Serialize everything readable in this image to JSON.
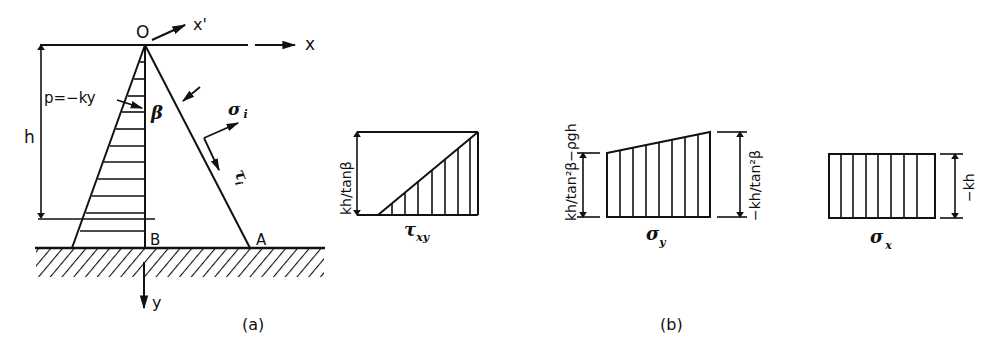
{
  "figure_a": {
    "caption": "(a)",
    "labels": {
      "origin": "O",
      "x_axis": "x",
      "x_prime": "x'",
      "y_axis": "y",
      "height": "h",
      "pressure": "p=−ky",
      "angle": "β",
      "normal_stress": "σ",
      "normal_stress_sub": "i",
      "shear_stress": "τ",
      "shear_stress_sub": "i",
      "point_b": "B",
      "point_a": "A"
    }
  },
  "figure_b": {
    "caption": "(b)",
    "tau_xy": {
      "name": "τ",
      "sub": "xy",
      "dimension": "kh/tanβ"
    },
    "sigma_y": {
      "name": "σ",
      "sub": "y",
      "dimension_left": "kh/tan²β−ρgh",
      "dimension_right": "−kh/tan²β"
    },
    "sigma_x": {
      "name": "σ",
      "sub": "x",
      "dimension": "−kh"
    }
  },
  "colors": {
    "ink": "#111111",
    "background": "#ffffff"
  }
}
